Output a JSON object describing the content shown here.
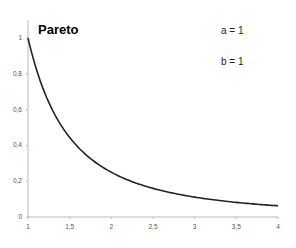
{
  "chart_data": {
    "type": "line",
    "title": "Pareto",
    "annotations": [
      "a = 1",
      "b = 1"
    ],
    "xlabel": "",
    "ylabel": "",
    "xlim": [
      1,
      4
    ],
    "ylim": [
      0,
      1
    ],
    "x_ticks": [
      1,
      1.5,
      2,
      2.5,
      3,
      3.5,
      4
    ],
    "x_tick_labels": [
      "1",
      "1,5",
      "2",
      "2,5",
      "3",
      "3,5",
      "4"
    ],
    "y_ticks": [
      0,
      0.2,
      0.4,
      0.6,
      0.8,
      1
    ],
    "y_tick_labels": [
      "0",
      "0,2",
      "0,4",
      "0,6",
      "0,8",
      "1"
    ],
    "grid": false,
    "legend": null,
    "series": [
      {
        "name": "Pareto pdf (a=1, b=1)",
        "formula": "a*b^a / x^(a+1)",
        "x": [
          1,
          1.25,
          1.5,
          1.75,
          2,
          2.25,
          2.5,
          2.75,
          3,
          3.25,
          3.5,
          3.75,
          4
        ],
        "values": [
          1.0,
          0.64,
          0.444,
          0.327,
          0.25,
          0.198,
          0.16,
          0.132,
          0.111,
          0.095,
          0.082,
          0.071,
          0.0625
        ]
      }
    ],
    "colors": {
      "line": "#222222",
      "axis": "#bbbbbb",
      "background": "#ffffff"
    }
  },
  "labels": {
    "title": "Pareto",
    "param_a": "a = 1",
    "param_b": "b = 1"
  }
}
